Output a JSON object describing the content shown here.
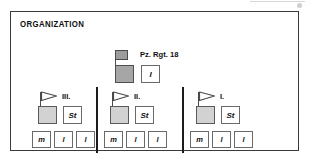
{
  "panel": {
    "title": "ORGANIZATION"
  },
  "regiment": {
    "label": "Pz. Rgt. 18",
    "flag_icon": "regiment-flag-icon",
    "unit_box_icon": "armor-unit-box",
    "staff_label": "I",
    "box_color": "#a6a6a6",
    "flag_color": "#9c9c9c"
  },
  "dividers": [
    {
      "name": "divider-left"
    },
    {
      "name": "divider-right"
    }
  ],
  "battalions": [
    {
      "roman": "III.",
      "flag_icon": "pennant-flag-icon",
      "staff_label": "St",
      "box_color": "#d2d2d2",
      "companies": [
        {
          "label": "m"
        },
        {
          "label": "l"
        },
        {
          "label": "l"
        }
      ]
    },
    {
      "roman": "II.",
      "flag_icon": "pennant-flag-icon",
      "staff_label": "St",
      "box_color": "#d2d2d2",
      "companies": [
        {
          "label": "m"
        },
        {
          "label": "l"
        },
        {
          "label": "l"
        }
      ]
    },
    {
      "roman": "I.",
      "flag_icon": "pennant-flag-icon",
      "staff_label": "St",
      "box_color": "#d2d2d2",
      "companies": [
        {
          "label": "m"
        },
        {
          "label": "l"
        },
        {
          "label": "l"
        }
      ]
    }
  ],
  "colors": {
    "frame_border": "#3a3a3a",
    "divider": "#1c1c1c",
    "text": "#101010",
    "background": "#ffffff"
  }
}
